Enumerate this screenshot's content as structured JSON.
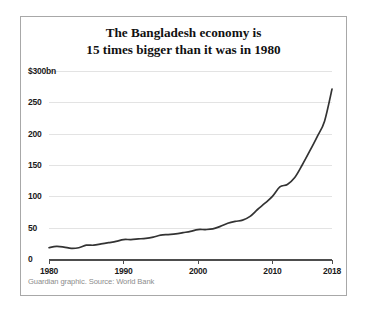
{
  "card": {
    "title_line1": "The Bangladesh economy is",
    "title_line2": "15 times bigger than it was in 1980",
    "source": "Guardian graphic. Source: World Bank",
    "border_color": "#a8a8a8",
    "background": "#ffffff"
  },
  "chart_data": {
    "type": "line",
    "title": "The Bangladesh economy is 15 times bigger than it was in 1980",
    "subtitle": "",
    "xlabel": "",
    "ylabel": "$300bn",
    "grid": true,
    "legend": "none",
    "line_color": "#333333",
    "xlim": [
      1980,
      2018
    ],
    "ylim": [
      0,
      300
    ],
    "ytick_labels": [
      "$300bn",
      "250",
      "200",
      "150",
      "100",
      "50",
      "0"
    ],
    "ytick_values": [
      300,
      250,
      200,
      150,
      100,
      50,
      0
    ],
    "xtick_labels": [
      "1980",
      "1990",
      "2000",
      "2010",
      "2018"
    ],
    "xtick_values": [
      1980,
      1990,
      2000,
      2010,
      2018
    ],
    "series": [
      {
        "name": "Bangladesh GDP",
        "units": "$bn",
        "x": [
          1980,
          1981,
          1982,
          1983,
          1984,
          1985,
          1986,
          1987,
          1988,
          1989,
          1990,
          1991,
          1992,
          1993,
          1994,
          1995,
          1996,
          1997,
          1998,
          1999,
          2000,
          2001,
          2002,
          2003,
          2004,
          2005,
          2006,
          2007,
          2008,
          2009,
          2010,
          2011,
          2012,
          2013,
          2014,
          2015,
          2016,
          2017,
          2018
        ],
        "values": [
          18,
          20,
          19,
          17,
          18,
          22,
          22,
          24,
          26,
          28,
          31,
          31,
          32,
          33,
          35,
          38,
          39,
          40,
          42,
          44,
          47,
          47,
          48,
          52,
          57,
          60,
          62,
          68,
          79,
          89,
          100,
          115,
          119,
          130,
          150,
          172,
          195,
          220,
          271
        ]
      }
    ]
  }
}
